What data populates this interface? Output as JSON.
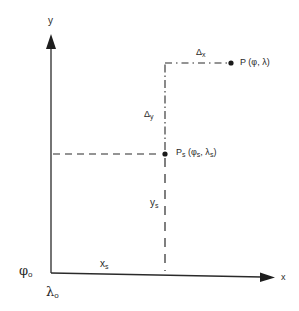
{
  "diagram": {
    "type": "coordinate-system",
    "axes": {
      "x_label": "x",
      "y_label": "y"
    },
    "origin": {
      "phi_label": "φ",
      "phi_sub": "o",
      "lambda_label": "λ",
      "lambda_sub": "o"
    },
    "point_p": {
      "label": "P (φ, λ)"
    },
    "point_ps": {
      "label_main": "P",
      "label_sub": "s",
      "coords_open": " (φ",
      "coords_phi_sub": "s",
      "coords_mid": ", λ",
      "coords_lambda_sub": "s",
      "coords_close": ")"
    },
    "deltas": {
      "dx_main": "Δ",
      "dx_sub": "x",
      "dy_main": "Δ",
      "dy_sub": "y"
    },
    "offsets": {
      "xs_main": "x",
      "xs_sub": "s",
      "ys_main": "y",
      "ys_sub": "s"
    },
    "colors": {
      "line": "#2a2a2a",
      "background": "#ffffff"
    }
  }
}
